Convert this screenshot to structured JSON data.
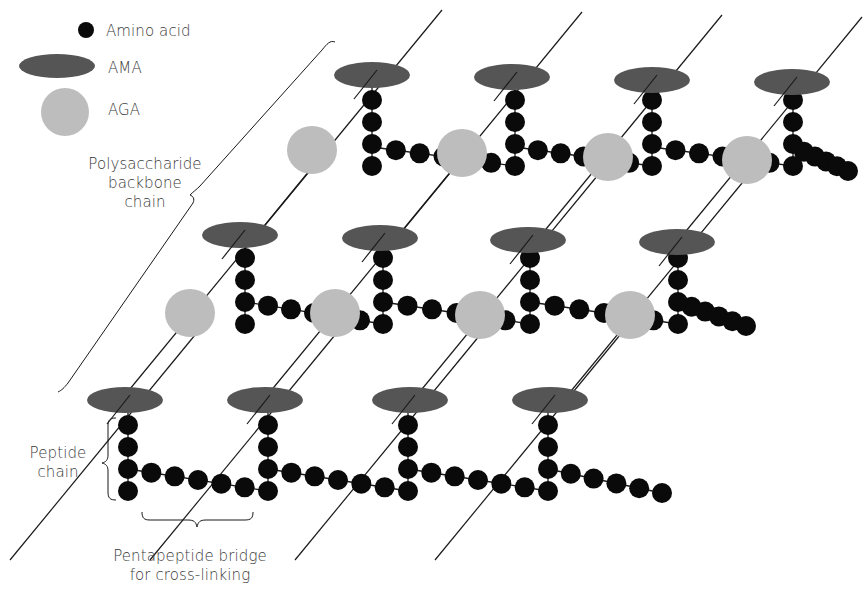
{
  "colors": {
    "amino_acid": "#0a0a0a",
    "ama": "#555555",
    "aga": "#bdbdbd",
    "line": "#1a1a1a",
    "text": "#3a3a3a"
  },
  "legend": {
    "items": [
      {
        "label": "Amino acid",
        "shape": "circle",
        "color_key": "amino_acid"
      },
      {
        "label": "AMA",
        "shape": "ellipse",
        "color_key": "ama"
      },
      {
        "label": "AGA",
        "shape": "circle",
        "color_key": "aga"
      }
    ]
  },
  "labels": {
    "backbone_line1": "Polysaccharide",
    "backbone_line2": "backbone",
    "backbone_line3": "chain",
    "peptide_line1": "Peptide",
    "peptide_line2": "chain",
    "bridge_line1": "Pentapeptide bridge",
    "bridge_line2": "for cross-linking"
  },
  "diagram": {
    "bead_radius": 10,
    "backbone_lines": [
      [
        60,
        392,
        335,
        42
      ],
      [
        135,
        386,
        432,
        10
      ],
      [
        200,
        330,
        560,
        10
      ],
      [
        275,
        495,
        720,
        10
      ],
      [
        420,
        495,
        850,
        50
      ],
      [
        560,
        495,
        830,
        110
      ],
      [
        175,
        330,
        390,
        50
      ],
      [
        320,
        330,
        520,
        60
      ],
      [
        460,
        330,
        660,
        60
      ],
      [
        610,
        330,
        780,
        80
      ],
      [
        140,
        380,
        300,
        160
      ],
      [
        280,
        380,
        450,
        160
      ]
    ],
    "rows": [
      {
        "name": "top",
        "ama": [
          [
            372,
            75
          ],
          [
            512,
            77
          ],
          [
            652,
            80
          ],
          [
            792,
            82
          ]
        ],
        "aga": [
          [
            312,
            150
          ],
          [
            462,
            153
          ],
          [
            608,
            157
          ],
          [
            747,
            160
          ]
        ],
        "columns": [
          372,
          515,
          652,
          793
        ],
        "col_top": 100,
        "bead_step": 22,
        "bridge_y": 147,
        "end_x": 848
      },
      {
        "name": "middle",
        "ama": [
          [
            240,
            235
          ],
          [
            380,
            238
          ],
          [
            528,
            240
          ],
          [
            677,
            242
          ]
        ],
        "aga": [
          [
            190,
            313
          ],
          [
            335,
            313
          ],
          [
            480,
            315
          ],
          [
            630,
            315
          ]
        ],
        "columns": [
          245,
          383,
          530,
          678
        ],
        "col_top": 258,
        "bead_step": 22,
        "bridge_y": 302,
        "end_x": 746
      },
      {
        "name": "bottom",
        "ama": [
          [
            125,
            400
          ],
          [
            265,
            400
          ],
          [
            410,
            400
          ],
          [
            550,
            400
          ]
        ],
        "aga": [],
        "columns": [
          128,
          268,
          408,
          548
        ],
        "col_top": 425,
        "bead_step": 22,
        "bridge_y": 469,
        "end_x": 662
      }
    ]
  }
}
